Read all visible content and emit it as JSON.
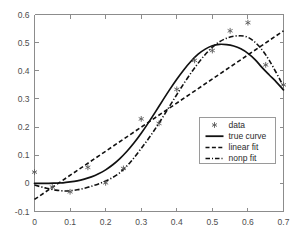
{
  "chart_data": {
    "type": "scatter",
    "title": "",
    "xlabel": "",
    "ylabel": "",
    "xlim": [
      0,
      0.7
    ],
    "ylim": [
      -0.1,
      0.6
    ],
    "xticks": [
      "0",
      "0.1",
      "0.2",
      "0.3",
      "0.4",
      "0.5",
      "0.6",
      "0.7"
    ],
    "xtick_values": [
      0,
      0.1,
      0.2,
      0.3,
      0.4,
      0.5,
      0.6,
      0.7
    ],
    "yticks": [
      "-0.1",
      "0",
      "0.1",
      "0.2",
      "0.3",
      "0.4",
      "0.5",
      "0.6"
    ],
    "ytick_values": [
      -0.1,
      0,
      0.1,
      0.2,
      0.3,
      0.4,
      0.5,
      0.6
    ],
    "grid": false,
    "legend_position": "lower right",
    "series": [
      {
        "name": "data",
        "type": "scatter",
        "marker": "asterisk",
        "color": "#5a5a5a",
        "x": [
          0.0,
          0.05,
          0.1,
          0.15,
          0.2,
          0.25,
          0.3,
          0.35,
          0.4,
          0.45,
          0.5,
          0.55,
          0.6,
          0.65,
          0.7
        ],
        "y": [
          0.04,
          -0.013,
          -0.03,
          0.057,
          0.002,
          0.053,
          0.229,
          0.213,
          0.334,
          0.437,
          0.472,
          0.542,
          0.571,
          0.421,
          0.35
        ]
      },
      {
        "name": "true curve",
        "type": "line",
        "linestyle": "solid",
        "color": "#111111",
        "x": [
          0.0,
          0.02,
          0.04,
          0.06,
          0.08,
          0.1,
          0.12,
          0.14,
          0.16,
          0.18,
          0.2,
          0.22,
          0.24,
          0.26,
          0.28,
          0.3,
          0.32,
          0.34,
          0.36,
          0.38,
          0.4,
          0.42,
          0.44,
          0.46,
          0.48,
          0.5,
          0.52,
          0.54,
          0.56,
          0.58,
          0.6,
          0.62,
          0.64,
          0.66,
          0.68,
          0.7
        ],
        "y": [
          0.0,
          0.0,
          0.0,
          0.001,
          0.002,
          0.005,
          0.009,
          0.015,
          0.023,
          0.034,
          0.048,
          0.066,
          0.088,
          0.114,
          0.144,
          0.178,
          0.215,
          0.254,
          0.294,
          0.333,
          0.37,
          0.404,
          0.434,
          0.459,
          0.477,
          0.489,
          0.494,
          0.493,
          0.488,
          0.478,
          0.462,
          0.44,
          0.411,
          0.385,
          0.36,
          0.332
        ]
      },
      {
        "name": "linear fit",
        "type": "line",
        "linestyle": "dashed",
        "color": "#111111",
        "x": [
          0.0,
          0.7
        ],
        "y": [
          -0.057,
          0.542
        ]
      },
      {
        "name": "nonp fit",
        "type": "line",
        "linestyle": "dashdot",
        "color": "#111111",
        "x": [
          0.0,
          0.03,
          0.06,
          0.09,
          0.12,
          0.15,
          0.18,
          0.21,
          0.24,
          0.27,
          0.3,
          0.33,
          0.36,
          0.39,
          0.42,
          0.45,
          0.48,
          0.51,
          0.54,
          0.57,
          0.6,
          0.63,
          0.66,
          0.7
        ],
        "y": [
          -0.006,
          -0.016,
          -0.024,
          -0.027,
          -0.023,
          -0.014,
          -0.002,
          0.014,
          0.038,
          0.076,
          0.124,
          0.176,
          0.234,
          0.295,
          0.355,
          0.41,
          0.458,
          0.494,
          0.516,
          0.524,
          0.519,
          0.489,
          0.437,
          0.345
        ]
      }
    ],
    "legend": [
      {
        "label": "data",
        "style": "marker"
      },
      {
        "label": "true curve",
        "style": "solid"
      },
      {
        "label": "linear fit",
        "style": "dashed"
      },
      {
        "label": "nonp fit",
        "style": "dashdot"
      }
    ],
    "colors": {
      "axis": "#8c8c8c",
      "tick_text": "#4d4d4d",
      "curve": "#111111",
      "marker": "#5a5a5a",
      "legend_border": "#9a9a9a",
      "background": "#ffffff"
    }
  }
}
